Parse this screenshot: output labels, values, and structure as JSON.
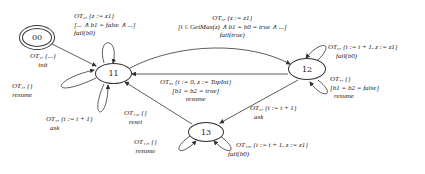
{
  "diagram": {
    "nodes": [
      {
        "id": "00",
        "label": "00",
        "initial": true
      },
      {
        "id": "11",
        "label": "11"
      },
      {
        "id": "12",
        "label": "12"
      },
      {
        "id": "13",
        "label": "13"
      }
    ],
    "edges": {
      "e_00_11": {
        "from": "00",
        "to": "11",
        "lines": [
          "OT₁, {...}",
          "init"
        ]
      },
      "e_11_11_top": {
        "from": "11",
        "to": "11",
        "lines": [
          "OT₂, {z := z1}",
          "[... ∧ b1 = false ∧ ...]",
          "fail(b0)"
        ]
      },
      "e_11_11_left": {
        "from": "11",
        "to": "11",
        "lines": [
          "OT₄, {}",
          "resume"
        ]
      },
      "e_11_11_bottom": {
        "from": "11",
        "to": "11",
        "lines": [
          "OT₅, {t := t + 1}",
          "ask"
        ]
      },
      "e_11_12": {
        "from": "11",
        "to": "12",
        "lines": [
          "OT₃, {z := z1}",
          "[t ≤ GetMax(z) ∧ b1 = b0 = true ∧ ...]",
          "fail(true)"
        ]
      },
      "e_12_11": {
        "from": "12",
        "to": "11",
        "lines": [
          "OT₈, {t := 0, z := TopInt}",
          "[b1 = b2 = true]",
          "resume"
        ]
      },
      "e_12_12_top": {
        "from": "12",
        "to": "12",
        "lines": [
          "OT₆, {t := t + 1, z := z1}",
          "fail(b0)"
        ]
      },
      "e_12_12_bottom": {
        "from": "12",
        "to": "12",
        "lines": [
          "OT₇, {}",
          "[b1 = b2 = false]",
          "resume"
        ]
      },
      "e_12_13": {
        "from": "12",
        "to": "13",
        "lines": [
          "OT₉, {t := t + 1}",
          "ask"
        ]
      },
      "e_13_11": {
        "from": "13",
        "to": "11",
        "lines": [
          "OT₁₂, {}",
          "reset"
        ]
      },
      "e_13_13_left": {
        "from": "13",
        "to": "13",
        "lines": [
          "OT₁₁, {}",
          "resume"
        ]
      },
      "e_13_13_right": {
        "from": "13",
        "to": "13",
        "lines": [
          "OT₁₀, {t := t + 1, z := z1}",
          "fail(b0)"
        ]
      }
    }
  }
}
